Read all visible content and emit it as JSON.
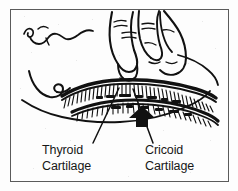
{
  "figure": {
    "border_color": "#5a5a5a",
    "ink_color": "#111111",
    "background_color": "#fdfdfd",
    "border": {
      "x": 10,
      "y": 9,
      "width": 218,
      "height": 172
    }
  },
  "labels": {
    "thyroid": {
      "line1": "Thyroid",
      "line2": "Cartilage",
      "x": 42,
      "y_line1": 154,
      "y_line2": 170,
      "leader": {
        "x1": 93,
        "y1": 143,
        "x2": 119,
        "y2": 88
      }
    },
    "cricoid": {
      "line1": "Cricoid",
      "line2": "Cartilage",
      "x": 145,
      "y_line1": 154,
      "y_line2": 170,
      "leader": {
        "x1": 153,
        "y1": 143,
        "x2": 133,
        "y2": 89
      }
    }
  },
  "arrow": {
    "name": "upward-pressure-arrow",
    "direction": "up",
    "color": "#111111",
    "x": 129,
    "y": 118
  },
  "anatomy": {
    "parts": [
      "head-profile-outline",
      "chin-and-jaw-curve",
      "neck-outline",
      "thyroid-cartilage-band",
      "cricoid-cartilage-band",
      "tracheal-rings-hatching",
      "hand-with-index-finger",
      "pressing-fingertip"
    ]
  }
}
